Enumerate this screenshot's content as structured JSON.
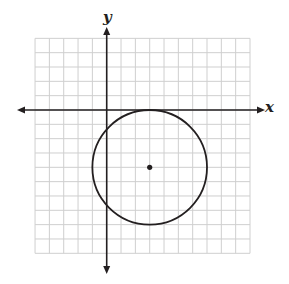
{
  "figure": {
    "type": "coordinate-plane-circle",
    "axes": {
      "x_label": "x",
      "y_label": "y"
    },
    "grid": {
      "columns": 15,
      "rows": 15,
      "x_min": -5,
      "x_max": 10,
      "y_min": -10,
      "y_max": 5,
      "unit_px": 14.33,
      "origin_px": [
        106.7,
        110
      ],
      "grid_color": "#cfcfcf",
      "axis_color": "#231f20"
    },
    "circle": {
      "center": [
        3,
        -4
      ],
      "radius": 4,
      "stroke_color": "#231f20",
      "center_dot": true
    }
  }
}
